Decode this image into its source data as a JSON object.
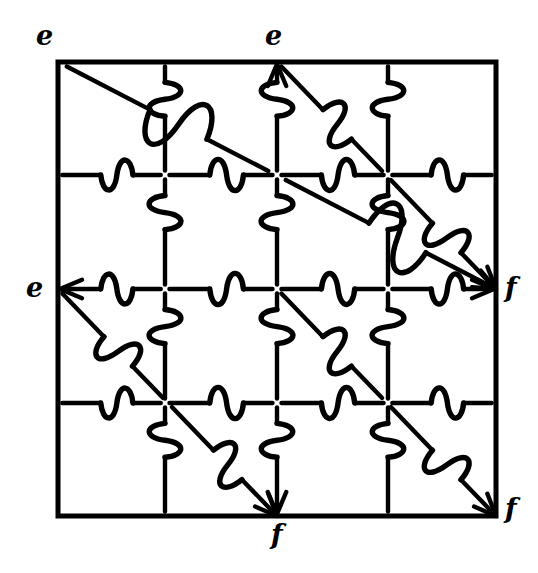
{
  "figure": {
    "kind": "topological-identification-diagram",
    "background_color": "#ffffff",
    "ink_color": "#000000",
    "square": {
      "left": 58,
      "top": 62,
      "right": 496,
      "bottom": 516,
      "border_width": 5
    },
    "grid": {
      "columns": 4,
      "rows": 4,
      "vertical_line_x": [
        165,
        277,
        388
      ],
      "horizontal_line_y": [
        175,
        289,
        403
      ],
      "line_width": 4.5,
      "interior_style": "dashed-with-jigsaw-tabs"
    },
    "diagonals": {
      "direction": "top-left-to-bottom-right",
      "count": 4,
      "line_width": 4.5,
      "arrow_heads": true,
      "segments": [
        {
          "x1": 58,
          "y1": 62,
          "x2": 496,
          "y2": 289
        },
        {
          "x1": 277,
          "y1": 62,
          "x2": 496,
          "y2": 289
        },
        {
          "x1": 58,
          "y1": 289,
          "x2": 277,
          "y2": 516
        },
        {
          "x1": 277,
          "y1": 289,
          "x2": 496,
          "y2": 516
        }
      ]
    },
    "tabs": {
      "shape": "s-curve-jigsaw-tab",
      "stroke_width": 5.5,
      "description": "Each interior segment is interrupted mid-way by an S-shaped jigsaw interlock."
    }
  },
  "labels": [
    {
      "id": "label-e-top-left",
      "text": "e",
      "x": 36,
      "y": 22,
      "anchor": "top-left",
      "letter": "e"
    },
    {
      "id": "label-e-top-middle",
      "text": "e",
      "x": 265,
      "y": 22,
      "anchor": "top-middle",
      "letter": "e"
    },
    {
      "id": "label-e-middle-left",
      "text": "e",
      "x": 26,
      "y": 274,
      "anchor": "middle-left",
      "letter": "e"
    },
    {
      "id": "label-f-middle-right",
      "text": "f",
      "x": 505,
      "y": 274,
      "anchor": "middle-right",
      "letter": "f"
    },
    {
      "id": "label-f-bottom-middle",
      "text": "f",
      "x": 271,
      "y": 521,
      "anchor": "bottom-middle",
      "letter": "f"
    },
    {
      "id": "label-f-bottom-right",
      "text": "f",
      "x": 505,
      "y": 495,
      "anchor": "bottom-right",
      "letter": "f"
    }
  ],
  "legend": {
    "edge_e": "e",
    "edge_f": "f"
  }
}
